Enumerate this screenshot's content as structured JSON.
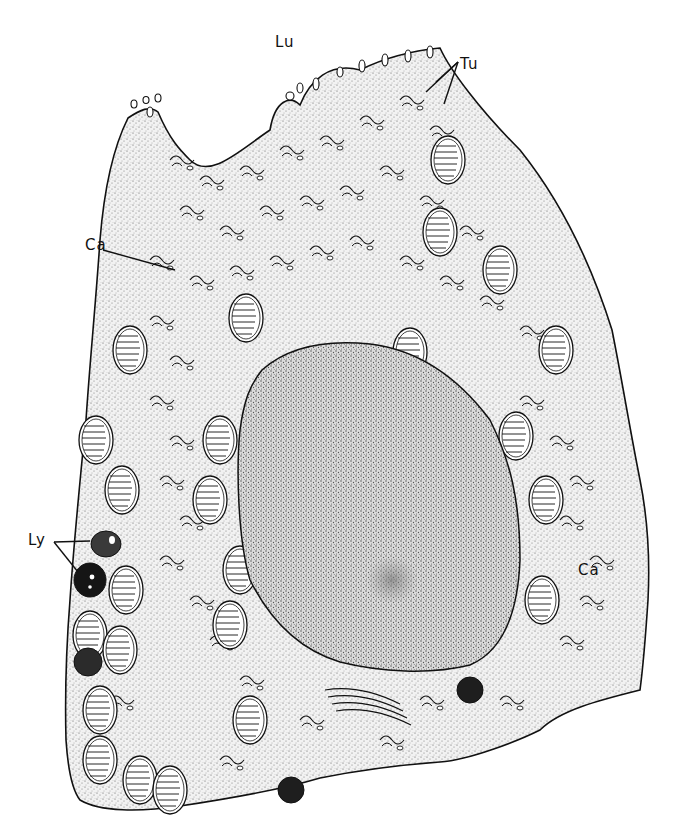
{
  "figure": {
    "style": "black-and-white stippled line drawing",
    "colors": {
      "ink": "#111111",
      "background": "#ffffff",
      "stipple": "#555555",
      "lysosome_dark": "#151515"
    },
    "labels": [
      {
        "id": "lu",
        "text": "Lu",
        "x": 275,
        "y": 35
      },
      {
        "id": "tu",
        "text": "Tu",
        "x": 460,
        "y": 57
      },
      {
        "id": "ca_left",
        "text": "Ca",
        "x": 85,
        "y": 238
      },
      {
        "id": "ly",
        "text": "Ly",
        "x": 28,
        "y": 541
      },
      {
        "id": "ca_right",
        "text": "Ca",
        "x": 578,
        "y": 563
      }
    ]
  }
}
